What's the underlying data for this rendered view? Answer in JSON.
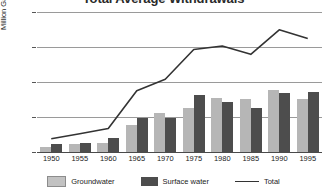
{
  "chart_data": {
    "type": "bar",
    "title": "Total Average Withdrawals",
    "xlabel": "",
    "ylabel": "Million Gallons per Day",
    "categories": [
      "1950",
      "1955",
      "1960",
      "1965",
      "1970",
      "1975",
      "1980",
      "1985",
      "1990",
      "1995"
    ],
    "ylim": [
      0,
      4000
    ],
    "yticks": [
      "0",
      "1,000",
      "2,000",
      "3,000",
      "4,000"
    ],
    "ytick_values": [
      0,
      1000,
      2000,
      3000,
      4000
    ],
    "grid": true,
    "legend_position": "bottom",
    "series": [
      {
        "name": "Groundwater",
        "type": "bar",
        "color": "#b6b6b6",
        "values": [
          130,
          230,
          270,
          760,
          1120,
          1270,
          1550,
          1510,
          1780,
          1520
        ]
      },
      {
        "name": "Surface water",
        "type": "bar",
        "color": "#4d4d4d",
        "values": [
          230,
          260,
          390,
          980,
          960,
          1630,
          1440,
          1260,
          1680,
          1710
        ]
      },
      {
        "name": "Total",
        "type": "line",
        "color": "#333333",
        "values": [
          380,
          520,
          670,
          1750,
          2080,
          2930,
          3030,
          2790,
          3490,
          3240
        ]
      }
    ]
  },
  "legend": {
    "groundwater_label": "Groundwater",
    "surface_label": "Surface water",
    "total_label": "Total"
  }
}
